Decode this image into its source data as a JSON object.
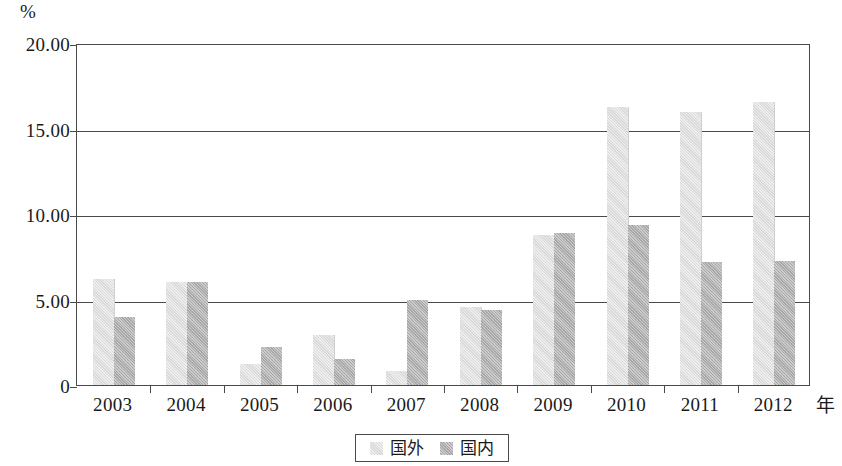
{
  "chart_data": {
    "type": "bar",
    "title": "",
    "subtitle": "",
    "xlabel": "年",
    "ylabel": "%",
    "categories": [
      "2003",
      "2004",
      "2005",
      "2006",
      "2007",
      "2008",
      "2009",
      "2010",
      "2011",
      "2012"
    ],
    "series": [
      {
        "name": "国外",
        "color": "#d9d9d9",
        "values": [
          6.2,
          6.05,
          1.25,
          2.9,
          0.8,
          4.55,
          8.75,
          16.25,
          15.95,
          16.55
        ]
      },
      {
        "name": "国内",
        "color": "#a8a8a8",
        "values": [
          3.95,
          6.05,
          2.25,
          1.55,
          5.0,
          4.4,
          8.9,
          9.35,
          7.2,
          7.25
        ]
      }
    ],
    "ylim": [
      0,
      20
    ],
    "ytick_values": [
      0,
      5,
      10,
      15,
      20
    ],
    "ytick_labels": [
      "0",
      "5.00",
      "10.00",
      "15.00",
      "20.00"
    ],
    "grid": "horizontal",
    "legend_position": "bottom-center"
  },
  "axes": {
    "y_unit_label": "%",
    "x_unit_label": "年"
  },
  "legend": {
    "items": [
      {
        "label": "国外"
      },
      {
        "label": "国内"
      }
    ]
  }
}
